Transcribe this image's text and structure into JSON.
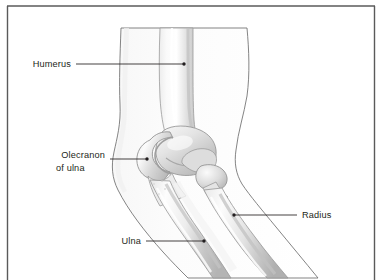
{
  "figure": {
    "frame": {
      "border_color": "#5a5a5a",
      "fill_color": "#ffffff"
    },
    "style": {
      "bone_fill": "#f2f2f2",
      "bone_outline": "#8c8c8c",
      "bone_shadow": "#bdbdbd",
      "skin_outline": "#6b6b6b",
      "skin_fill": "#fbfbfb",
      "leader_color": "#231f20",
      "text_color": "#231f20"
    },
    "labels": [
      {
        "id": "humerus",
        "text": "Humerus",
        "text_x": 71,
        "text_y": 67,
        "text_anchor": "end",
        "leader_from_x": 76,
        "leader_from_y": 64,
        "leader_to_x": 184,
        "leader_to_y": 64,
        "dot_x": 184,
        "dot_y": 64
      },
      {
        "id": "olecranon-of-ulna",
        "text": "Olecranon",
        "text2": "of ulna",
        "text_x": 105,
        "text_y": 158,
        "text2_x": 56,
        "text2_y": 171,
        "text_anchor": "end",
        "leader_from_x": 110,
        "leader_from_y": 159,
        "leader_to_x": 147,
        "leader_to_y": 159,
        "dot_x": 147,
        "dot_y": 159
      },
      {
        "id": "radius",
        "text": "Radius",
        "text_x": 302,
        "text_y": 218,
        "text_anchor": "start",
        "leader_from_x": 297,
        "leader_from_y": 215,
        "leader_to_x": 234,
        "leader_to_y": 215,
        "dot_x": 234,
        "dot_y": 215
      },
      {
        "id": "ulna",
        "text": "Ulna",
        "text_x": 141,
        "text_y": 244,
        "text_anchor": "end",
        "leader_from_x": 146,
        "leader_from_y": 241,
        "leader_to_x": 204,
        "leader_to_y": 241,
        "dot_x": 204,
        "dot_y": 241
      }
    ],
    "structures": [
      {
        "id": "humerus",
        "name": "Humerus",
        "description": "upper arm bone, vertical shaft widening to condyle at elbow"
      },
      {
        "id": "olecranon",
        "name": "Olecranon of ulna",
        "description": "hook-shaped proximal process of the ulna wrapping the humeral condyle"
      },
      {
        "id": "radius",
        "name": "Radius",
        "description": "lateral forearm bone with rounded head at the elbow"
      },
      {
        "id": "ulna",
        "name": "Ulna",
        "description": "medial forearm bone running diagonally to the wrist"
      },
      {
        "id": "arm-outline",
        "name": "Arm skin outline",
        "description": "contour of upper arm and forearm"
      }
    ]
  }
}
